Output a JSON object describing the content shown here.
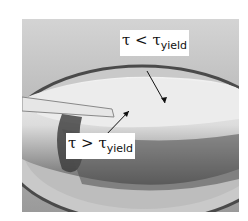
{
  "figure": {
    "labels": {
      "top": {
        "symbol": "τ < τ",
        "subscript": "yield"
      },
      "bottom": {
        "symbol": "τ > τ",
        "subscript": "yield"
      }
    }
  }
}
